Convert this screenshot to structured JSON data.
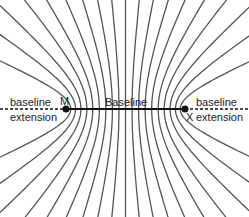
{
  "diagram": {
    "stations": [
      {
        "id": "M",
        "label": "M",
        "x": 66,
        "y": 109
      },
      {
        "id": "X",
        "label": "X",
        "x": 185,
        "y": 109
      }
    ],
    "labels": {
      "baseline": "Baseline",
      "left_extension_line1": "baseline",
      "left_extension_line2": "extension",
      "right_extension_line1": "baseline",
      "right_extension_line2": "extension",
      "station_m": "M",
      "station_x": "X"
    },
    "hyperbola_ratios": [
      0,
      0.11,
      0.22,
      0.33,
      0.44,
      0.55,
      0.65,
      0.75,
      0.84,
      0.92
    ],
    "colors": {
      "lines": "#555555",
      "baseline": "#111111",
      "station": "#111111",
      "text": "#222222"
    }
  }
}
